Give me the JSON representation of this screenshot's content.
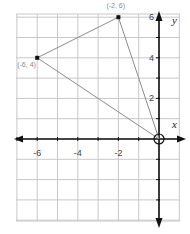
{
  "chart_data": {
    "type": "scatter",
    "title": "",
    "xlabel": "x",
    "ylabel": "y",
    "xlim": [
      -7,
      1
    ],
    "ylim": [
      -3,
      7
    ],
    "grid": true,
    "x_ticks": [
      {
        "value": -6,
        "label": "-6"
      },
      {
        "value": -4,
        "label": "-4"
      },
      {
        "value": -2,
        "label": "-2"
      }
    ],
    "y_ticks": [
      {
        "value": 2,
        "label": "2"
      },
      {
        "value": 4,
        "label": "4"
      },
      {
        "value": 6,
        "label": "6"
      }
    ],
    "points": [
      {
        "x": -2,
        "y": 6,
        "label": "(-2, 6)"
      },
      {
        "x": -6,
        "y": 4,
        "label": "(-6, 4)"
      },
      {
        "x": 0,
        "y": 0,
        "label": "",
        "marker": "open-circle"
      }
    ],
    "polygon": {
      "name": "triangle",
      "vertices": [
        [
          -2,
          6
        ],
        [
          -6,
          4
        ],
        [
          0,
          0
        ]
      ],
      "edge_color": "#888888"
    }
  },
  "colors": {
    "grid": "#c8c8c8",
    "axis": "#111111",
    "edge": "#8c8c8c",
    "point": "#111111"
  }
}
